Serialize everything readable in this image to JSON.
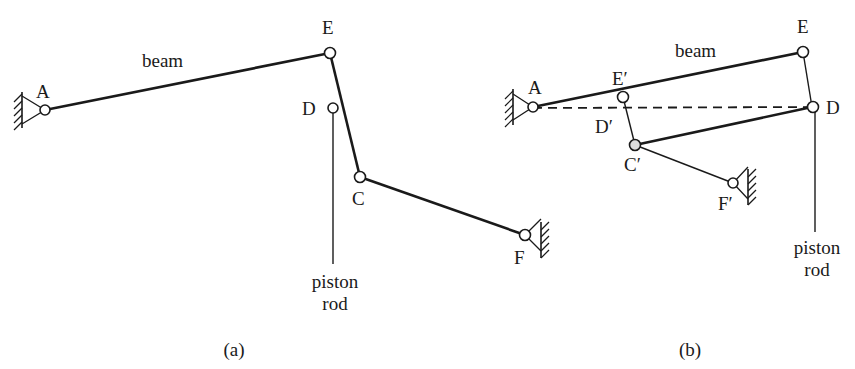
{
  "figure_a": {
    "caption": "(a)",
    "beam_label": "beam",
    "piston_label_line1": "piston",
    "piston_label_line2": "rod",
    "points": {
      "A": "A",
      "E": "E",
      "D": "D",
      "C": "C",
      "F": "F"
    }
  },
  "figure_b": {
    "caption": "(b)",
    "beam_label": "beam",
    "piston_label_line1": "piston",
    "piston_label_line2": "rod",
    "points": {
      "A": "A",
      "E": "E",
      "E_prime": "E′",
      "D": "D",
      "D_prime": "D′",
      "C_prime": "C′",
      "F_prime": "F′"
    }
  },
  "colors": {
    "ink": "#1a1a1a",
    "background": "#ffffff"
  }
}
